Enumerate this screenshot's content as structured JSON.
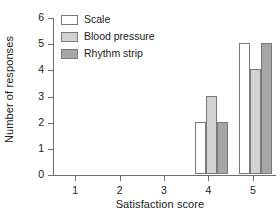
{
  "chart_data": {
    "type": "bar",
    "title": "",
    "xlabel": "Satisfaction score",
    "ylabel": "Number of responses",
    "categories": [
      "1",
      "2",
      "3",
      "4",
      "5"
    ],
    "series": [
      {
        "name": "Scale",
        "color": "#ffffff",
        "values": [
          0,
          0,
          0,
          2,
          5
        ]
      },
      {
        "name": "Blood pressure",
        "color": "#d2d2d2",
        "values": [
          0,
          0,
          0,
          3,
          4
        ]
      },
      {
        "name": "Rhythm strip",
        "color": "#a6a6a6",
        "values": [
          0,
          0,
          0,
          2,
          5
        ]
      }
    ],
    "ylim": [
      0,
      6
    ],
    "yticks": [
      "0",
      "1",
      "2",
      "3",
      "4",
      "5",
      "6"
    ],
    "grid": false,
    "legend_position": "top-left"
  }
}
